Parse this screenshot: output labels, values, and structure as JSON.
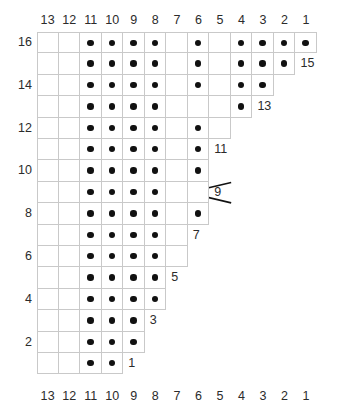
{
  "chart_data": {
    "type": "table",
    "columns": 13,
    "rows": 16,
    "column_labels_top": [
      "13",
      "12",
      "11",
      "10",
      "9",
      "8",
      "7",
      "6",
      "5",
      "4",
      "3",
      "2",
      "1"
    ],
    "column_labels_bottom": [
      "13",
      "12",
      "11",
      "10",
      "9",
      "8",
      "7",
      "6",
      "5",
      "4",
      "3",
      "2",
      "1"
    ],
    "row_labels_left": [
      "16",
      "14",
      "12",
      "10",
      "8",
      "6",
      "4",
      "2"
    ],
    "row_labels_right": [
      "15",
      "13",
      "11",
      "9",
      "7",
      "5",
      "3",
      "1"
    ],
    "legend": {
      "dot": "purl stitch",
      "blank": "knit stitch",
      "cross": "cable cross over 4 stitches"
    },
    "colors": {
      "grid_line": "#c9c9c9",
      "dot": "#111111",
      "symbol": "#111111",
      "text": "#2b2b2b",
      "background": "#ffffff"
    },
    "rows_data": [
      {
        "row": 16,
        "label_side": "left",
        "label": "16",
        "cells": 13,
        "dots": [
          11,
          10,
          9,
          8,
          6,
          4,
          3,
          2,
          1
        ],
        "cable": null
      },
      {
        "row": 15,
        "label_side": "right",
        "label": "15",
        "cells": 12,
        "dots": [
          11,
          10,
          9,
          8,
          6,
          4,
          3,
          2
        ],
        "cable": null
      },
      {
        "row": 14,
        "label_side": "left",
        "label": "14",
        "cells": 11,
        "dots": [
          11,
          10,
          9,
          8,
          6,
          4,
          3
        ],
        "cable": null
      },
      {
        "row": 13,
        "label_side": "right",
        "label": "13",
        "cells": 10,
        "dots": [
          11,
          10,
          9,
          8,
          4,
          3
        ],
        "cable": {
          "from": 8,
          "to": 5
        }
      },
      {
        "row": 12,
        "label_side": "left",
        "label": "12",
        "cells": 9,
        "dots": [
          11,
          10,
          9,
          8,
          6,
          4,
          3
        ],
        "cable": null
      },
      {
        "row": 11,
        "label_side": "right",
        "label": "11",
        "cells": 8,
        "dots": [
          11,
          10,
          9,
          8,
          6,
          4
        ],
        "cable": null
      },
      {
        "row": 10,
        "label_side": "left",
        "label": "10",
        "cells": 8,
        "dots": [
          11,
          10,
          9,
          8,
          6,
          4
        ],
        "cable": null
      },
      {
        "row": 9,
        "label_side": "right",
        "label": "9",
        "cells": 8,
        "dots": [
          11,
          10,
          9,
          8
        ],
        "cable": {
          "from": 8,
          "to": 5
        }
      },
      {
        "row": 8,
        "label_side": "left",
        "label": "8",
        "cells": 8,
        "dots": [
          11,
          10,
          9,
          8,
          6
        ],
        "cable": null
      },
      {
        "row": 7,
        "label_side": "right",
        "label": "7",
        "cells": 7,
        "dots": [
          11,
          10,
          9,
          8,
          6
        ],
        "cable": null
      },
      {
        "row": 6,
        "label_side": "left",
        "label": "6",
        "cells": 7,
        "dots": [
          11,
          10,
          9,
          8,
          6
        ],
        "cable": null
      },
      {
        "row": 5,
        "label_side": "right",
        "label": "5",
        "cells": 6,
        "dots": [
          11,
          10,
          9,
          8
        ],
        "cable": null
      },
      {
        "row": 4,
        "label_side": "left",
        "label": "4",
        "cells": 6,
        "dots": [
          11,
          10,
          9,
          8
        ],
        "cable": null
      },
      {
        "row": 3,
        "label_side": "right",
        "label": "3",
        "cells": 5,
        "dots": [
          11,
          10,
          9,
          8
        ],
        "cable": null
      },
      {
        "row": 2,
        "label_side": "left",
        "label": "2",
        "cells": 5,
        "dots": [
          11,
          10,
          9,
          8
        ],
        "cable": null
      },
      {
        "row": 1,
        "label_side": "right",
        "label": "1",
        "cells": 4,
        "dots": [
          11,
          10,
          9
        ],
        "cable": null
      }
    ]
  }
}
